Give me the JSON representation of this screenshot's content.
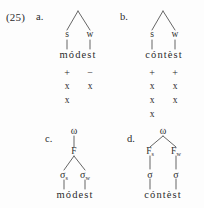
{
  "figure": {
    "example_number": "(25)",
    "panels": [
      {
        "letter": "a.",
        "type": "metrical-tree-with-grid",
        "tree": {
          "apex": "",
          "leaves": [
            {
              "label": "s"
            },
            {
              "label": "w"
            }
          ]
        },
        "word": "módest",
        "grid": {
          "signs": [
            "+",
            "−"
          ],
          "rows": [
            [
              "x",
              "x"
            ],
            [
              "x",
              ""
            ]
          ]
        }
      },
      {
        "letter": "b.",
        "type": "metrical-tree-with-grid",
        "tree": {
          "apex": "",
          "leaves": [
            {
              "label": "s"
            },
            {
              "label": "w"
            }
          ]
        },
        "word": "cóntèst",
        "grid": {
          "signs": [
            "+",
            "+"
          ],
          "rows": [
            [
              "x",
              "x"
            ],
            [
              "x",
              "x"
            ],
            [
              "x",
              ""
            ]
          ]
        }
      },
      {
        "letter": "c.",
        "type": "prosodic-tree",
        "tree": {
          "root": "ω",
          "foot_level": [
            {
              "base": "F",
              "sub": ""
            }
          ],
          "syllable_level": [
            {
              "base": "σ",
              "sub": "s"
            },
            {
              "base": "σ",
              "sub": "w"
            }
          ]
        },
        "word": "módest"
      },
      {
        "letter": "d.",
        "type": "prosodic-tree",
        "tree": {
          "root": "ω",
          "foot_level": [
            {
              "base": "F",
              "sub": "s"
            },
            {
              "base": "F",
              "sub": "w"
            }
          ],
          "syllable_level": [
            {
              "base": "σ",
              "sub": ""
            },
            {
              "base": "σ",
              "sub": ""
            }
          ]
        },
        "word": "cóntèst"
      }
    ]
  },
  "colors": {
    "background": "#fdfdfd",
    "ink": "#2b2b2b",
    "line": "#4a4a4a"
  }
}
